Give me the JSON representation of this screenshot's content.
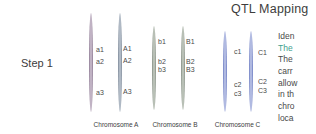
{
  "title": "QTL Mapping",
  "step": {
    "label": "Step 1"
  },
  "pairs": [
    {
      "caption": "Chromosome A",
      "left_markers": [
        "a1",
        "a2",
        "a3"
      ],
      "right_markers": [
        "A1",
        "A2",
        "A3"
      ]
    },
    {
      "caption": "Chromosome B",
      "left_markers": [
        "b1",
        "b2",
        "b3"
      ],
      "right_markers": [
        "B1",
        "B2",
        "B3"
      ]
    },
    {
      "caption": "Chromosome C",
      "left_markers": [
        "c1",
        "c2",
        "c3"
      ],
      "right_markers": [
        "C1",
        "C2",
        "C3"
      ]
    }
  ],
  "description": {
    "lines": [
      "Iden",
      "The",
      "The",
      "carr",
      "allow",
      "in th",
      "chro",
      "loca"
    ],
    "highlighted_line_index": 1
  },
  "colors": {
    "text_dark": "#3d3d3d",
    "marker_text": "#4a4a4a",
    "desc_text": "#4a4a4a",
    "highlight": "#3f9f8f",
    "chr_a_left_edge": "#8e7b94",
    "chr_a_left_mid": "#cabdcd",
    "chr_a_right_edge": "#7e8a99",
    "chr_a_right_mid": "#b9c2cd",
    "chr_b_edge": "#868f85",
    "chr_b_mid": "#c2c9bf",
    "chr_c_edge": "#6e7ec3",
    "chr_c_mid": "#bdc5e7"
  }
}
